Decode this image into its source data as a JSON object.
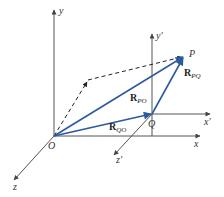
{
  "diagram": {
    "colors": {
      "axis": "#555555",
      "vector": "#2b5aa0",
      "dashed": "#222222",
      "text": "#333333"
    },
    "points": {
      "O": {
        "label": "O",
        "x": 54,
        "y": 136
      },
      "Q": {
        "label": "Q",
        "x": 152,
        "y": 114
      },
      "P": {
        "label": "P",
        "x": 184,
        "y": 56
      }
    },
    "axes": {
      "x": {
        "label": "x"
      },
      "y": {
        "label": "y"
      },
      "z": {
        "label": "z"
      },
      "x_prime": {
        "label": "x′"
      },
      "y_prime": {
        "label": "y′"
      },
      "z_prime": {
        "label": "z′"
      }
    },
    "vectors": {
      "R_PO": {
        "main": "R",
        "sub": "PO"
      },
      "R_QO": {
        "main": "R",
        "sub": "QO"
      },
      "R_PQ": {
        "main": "R",
        "sub": "PQ"
      }
    }
  }
}
